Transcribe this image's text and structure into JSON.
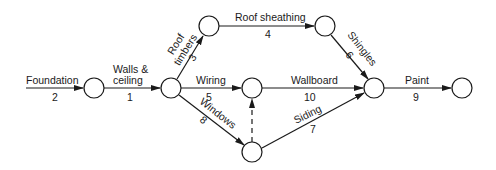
{
  "diagram": {
    "type": "activity-on-arrow network",
    "nodes": [
      {
        "id": "n1"
      },
      {
        "id": "n2"
      },
      {
        "id": "n3"
      },
      {
        "id": "n4"
      },
      {
        "id": "n5"
      },
      {
        "id": "n6"
      },
      {
        "id": "n7"
      },
      {
        "id": "n8"
      }
    ],
    "activities": {
      "foundation": {
        "label": "Foundation",
        "duration": "2"
      },
      "walls_ceiling": {
        "label_line1": "Walls &",
        "label_line2": "ceiling",
        "duration": "1"
      },
      "roof_timbers": {
        "label_line1": "Roof",
        "label_line2": "timbers",
        "duration": "3"
      },
      "roof_sheathing": {
        "label": "Roof sheathing",
        "duration": "4"
      },
      "shingles": {
        "label": "Shingles",
        "duration": "6"
      },
      "wiring": {
        "label": "Wiring",
        "duration": "5"
      },
      "wallboard": {
        "label": "Wallboard",
        "duration": "10"
      },
      "windows": {
        "label": "Windows",
        "duration": "8"
      },
      "siding": {
        "label": "Siding",
        "duration": "7"
      },
      "paint": {
        "label": "Paint",
        "duration": "9"
      },
      "dummy": {
        "label": "",
        "duration": ""
      }
    }
  }
}
